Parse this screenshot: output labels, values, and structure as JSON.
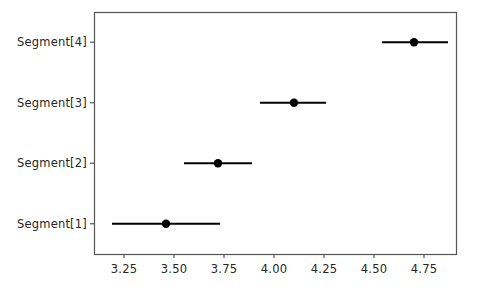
{
  "chart_data": {
    "type": "scatter",
    "title": "",
    "xlabel": "",
    "ylabel": "",
    "orientation": "horizontal",
    "grid": false,
    "legend": null,
    "xlim": [
      3.1,
      4.91
    ],
    "xticks": [
      3.25,
      3.5,
      3.75,
      4.0,
      4.25,
      4.5,
      4.75
    ],
    "xticklabels": [
      "3.25",
      "3.50",
      "3.75",
      "4.00",
      "4.25",
      "4.50",
      "4.75"
    ],
    "categories": [
      "Segment[1]",
      "Segment[2]",
      "Segment[3]",
      "Segment[4]"
    ],
    "category_order_top_to_bottom": [
      "Segment[4]",
      "Segment[3]",
      "Segment[2]",
      "Segment[1]"
    ],
    "marker": "circle",
    "marker_color": "#000000",
    "error_bar_color": "#000000",
    "points": [
      {
        "label": "Segment[4]",
        "value": 4.7,
        "low": 4.54,
        "high": 4.87,
        "row_from_top": 0
      },
      {
        "label": "Segment[3]",
        "value": 4.1,
        "low": 3.93,
        "high": 4.26,
        "row_from_top": 1
      },
      {
        "label": "Segment[2]",
        "value": 3.72,
        "low": 3.55,
        "high": 3.89,
        "row_from_top": 2
      },
      {
        "label": "Segment[1]",
        "value": 3.46,
        "low": 3.19,
        "high": 3.73,
        "row_from_top": 3
      }
    ],
    "series": [
      {
        "name": "estimate",
        "values": [
          3.46,
          3.72,
          4.1,
          4.7
        ]
      },
      {
        "name": "ci_low",
        "values": [
          3.19,
          3.55,
          3.93,
          4.54
        ]
      },
      {
        "name": "ci_high",
        "values": [
          3.73,
          3.89,
          4.26,
          4.87
        ]
      }
    ]
  },
  "axes": {
    "spine_color": "#555555",
    "tick_color": "#555555",
    "text_color": "#262626",
    "background": "#ffffff",
    "plot_box": {
      "left": 94,
      "top": 12,
      "right": 456,
      "bottom": 254
    }
  },
  "x_tick_labels": [
    "3.25",
    "3.50",
    "3.75",
    "4.00",
    "4.25",
    "4.50",
    "4.75"
  ],
  "y_tick_labels": [
    "Segment[4]",
    "Segment[3]",
    "Segment[2]",
    "Segment[1]"
  ]
}
